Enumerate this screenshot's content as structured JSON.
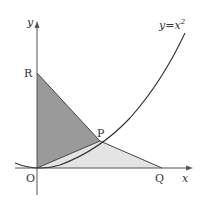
{
  "figure": {
    "curve_label": "y=x²",
    "curve_label_base": "y=x",
    "curve_label_exp": "2",
    "axis_x_label": "x",
    "axis_y_label": "y",
    "points": {
      "O": {
        "label": "O",
        "px": [
          37,
          168
        ]
      },
      "R": {
        "label": "R",
        "px": [
          37,
          73
        ]
      },
      "P": {
        "label": "P",
        "px": [
          100,
          141
        ]
      },
      "Q": {
        "label": "Q",
        "px": [
          162,
          168
        ]
      }
    },
    "regions": [
      {
        "name": "triangle-OPR",
        "vertices": [
          "O",
          "P",
          "R"
        ],
        "fill": "#9a9a9a"
      },
      {
        "name": "triangle-OPQ",
        "vertices": [
          "O",
          "P",
          "Q"
        ],
        "fill": "#e4e4e4"
      }
    ],
    "colors": {
      "axis": "#555555",
      "curve": "#333333",
      "dark_fill": "#9a9a9a",
      "light_fill": "#e4e4e4"
    }
  }
}
